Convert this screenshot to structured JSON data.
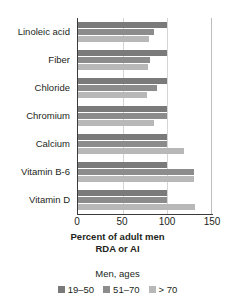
{
  "chart_data": {
    "type": "bar",
    "orientation": "horizontal",
    "title": "",
    "xlabel": "Percent of adult men RDA or AI",
    "xlabel_line1": "Percent of adult men",
    "xlabel_line2": "RDA or AI",
    "ylabel": "",
    "xlim": [
      0,
      150
    ],
    "xticks": [
      0,
      50,
      100,
      150
    ],
    "xtick_labels": [
      "0",
      "50",
      "100",
      "150"
    ],
    "gridlines": [
      50,
      100
    ],
    "grid": true,
    "legend_position": "bottom",
    "legend_title": "Men, ages",
    "categories": [
      "Linoleic acid",
      "Fiber",
      "Chloride",
      "Chromium",
      "Calcium",
      "Vitamin B-6",
      "Vitamin D"
    ],
    "series": [
      {
        "name": "19–50",
        "color": "#7a7a7a",
        "values": [
          100,
          100,
          100,
          100,
          100,
          100,
          100
        ]
      },
      {
        "name": "51–70",
        "color": "#8c8c8c",
        "values": [
          85,
          81,
          88,
          100,
          100,
          130,
          100
        ]
      },
      {
        "name": "> 70",
        "color": "#b8b8b8",
        "values": [
          80,
          78,
          77,
          85,
          119,
          130,
          131
        ]
      }
    ]
  },
  "colors": {
    "axis": "#3a3a3a",
    "grid": "#d5d5d5",
    "text": "#231f20",
    "background": "#ffffff"
  }
}
